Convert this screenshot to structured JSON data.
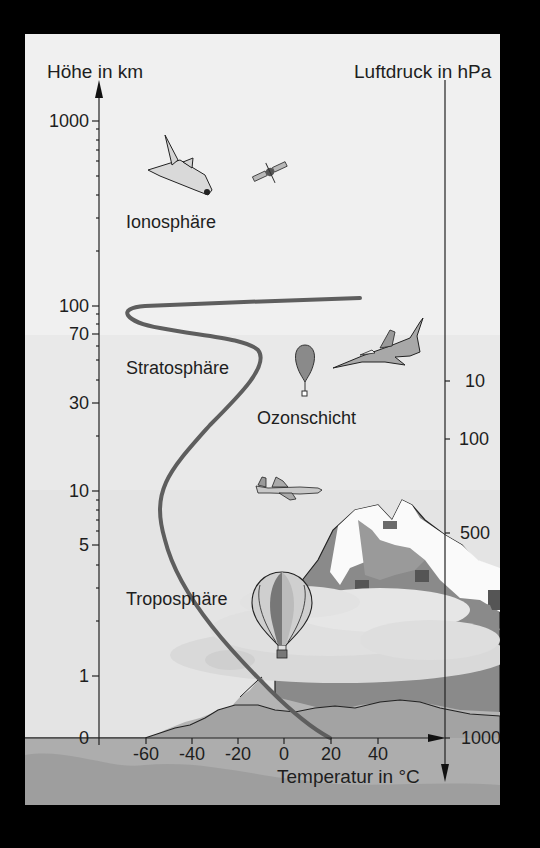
{
  "diagram": {
    "left_axis": {
      "title": "Höhe in km",
      "ticks": [
        {
          "label": "1000",
          "y": 121
        },
        {
          "label": "100",
          "y": 306
        },
        {
          "label": "70",
          "y": 334
        },
        {
          "label": "30",
          "y": 403
        },
        {
          "label": "10",
          "y": 491
        },
        {
          "label": "5",
          "y": 545
        },
        {
          "label": "1",
          "y": 676
        },
        {
          "label": "0",
          "y": 738
        }
      ]
    },
    "right_axis": {
      "title": "Luftdruck in hPa",
      "ticks": [
        {
          "label": "10",
          "y": 381
        },
        {
          "label": "100",
          "y": 439
        },
        {
          "label": "500",
          "y": 533
        },
        {
          "label": "1000",
          "y": 738
        }
      ]
    },
    "bottom_axis": {
      "title": "Temperatur in °C",
      "ticks": [
        {
          "label": "-60",
          "x": 146
        },
        {
          "label": "-40",
          "x": 192
        },
        {
          "label": "-20",
          "x": 238
        },
        {
          "label": "0",
          "x": 284
        },
        {
          "label": "20",
          "x": 331
        },
        {
          "label": "40",
          "x": 378
        }
      ]
    },
    "layers": [
      {
        "name": "Ionosphäre"
      },
      {
        "name": "Stratosphäre"
      },
      {
        "name": "Ozonschicht"
      },
      {
        "name": "Troposphäre"
      }
    ],
    "illustrations": [
      "space-shuttle",
      "satellite",
      "weather-balloon",
      "fighter-jet",
      "airliner",
      "hot-air-balloon",
      "mountains",
      "clouds",
      "hills"
    ],
    "colors": {
      "background_light": "#efefef",
      "background_mid": "#e6e6e6",
      "ground": "#a9a9a9",
      "curve": "#5a5a5a",
      "axis": "#222222"
    }
  }
}
